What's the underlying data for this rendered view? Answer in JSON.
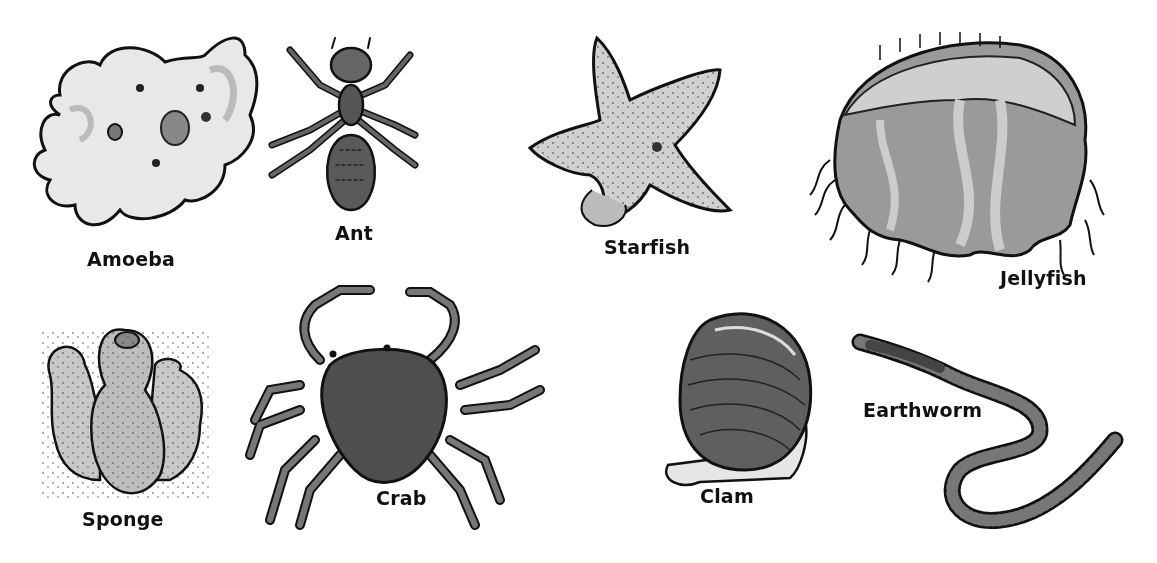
{
  "figure": {
    "organisms": [
      {
        "id": "amoeba",
        "label": "Amoeba"
      },
      {
        "id": "ant",
        "label": "Ant"
      },
      {
        "id": "starfish",
        "label": "Starfish"
      },
      {
        "id": "jellyfish",
        "label": "Jellyfish"
      },
      {
        "id": "sponge",
        "label": "Sponge"
      },
      {
        "id": "crab",
        "label": "Crab"
      },
      {
        "id": "clam",
        "label": "Clam"
      },
      {
        "id": "earthworm",
        "label": "Earthworm"
      }
    ]
  }
}
